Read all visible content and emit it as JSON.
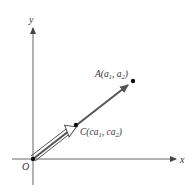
{
  "diagram": {
    "type": "vector-scalar-multiple",
    "axes": {
      "x_label": "x",
      "y_label": "y",
      "origin_label": "O"
    },
    "points": [
      {
        "id": "A",
        "label_main": "A(a",
        "sub1": "1",
        "mid": ", a",
        "sub2": "2",
        "end": ")"
      },
      {
        "id": "C",
        "label_main": "C(ca",
        "sub1": "1",
        "mid": ", ca",
        "sub2": "2",
        "end": ")"
      }
    ],
    "colors": {
      "axis": "#555555",
      "vector_OA": "#555555",
      "vector_OC": "#666666",
      "point": "#111111",
      "text": "#333333"
    }
  }
}
